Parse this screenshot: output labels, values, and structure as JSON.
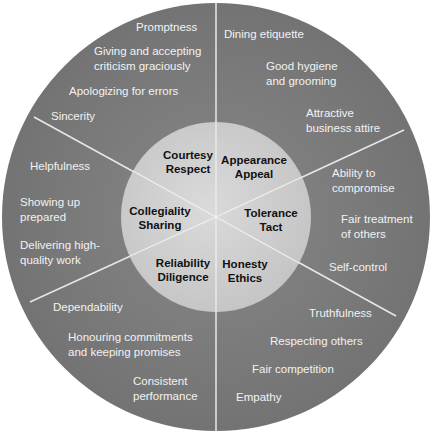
{
  "colors": {
    "outer_ring": "#7a7a7a",
    "inner_circle": "#cfcfcf",
    "divider": "#e8e8e8",
    "outer_text": "#f2f2f2",
    "core_text": "#111111"
  },
  "segments": [
    {
      "core": [
        "Courtesy",
        "Respect"
      ],
      "items": [
        "Promptness",
        "Giving and accepting\ncriticism graciously",
        "Apologizing for errors",
        "Sincerity"
      ]
    },
    {
      "core": [
        "Appearance",
        "Appeal"
      ],
      "items": [
        "Dining etiquette",
        "Good hygiene\nand grooming",
        "Attractive\nbusiness attire"
      ]
    },
    {
      "core": [
        "Tolerance",
        "Tact"
      ],
      "items": [
        "Ability to\ncompromise",
        "Fair treatment\nof others",
        "Self-control"
      ]
    },
    {
      "core": [
        "Honesty",
        "Ethics"
      ],
      "items": [
        "Truthfulness",
        "Respecting others",
        "Fair competition",
        "Empathy"
      ]
    },
    {
      "core": [
        "Reliability",
        "Diligence"
      ],
      "items": [
        "Dependability",
        "Honouring commitments\nand keeping promises",
        "Consistent\nperformance"
      ]
    },
    {
      "core": [
        "Collegiality",
        "Sharing"
      ],
      "items": [
        "Helpfulness",
        "Showing up\nprepared",
        "Delivering high-\nquality work"
      ]
    }
  ]
}
